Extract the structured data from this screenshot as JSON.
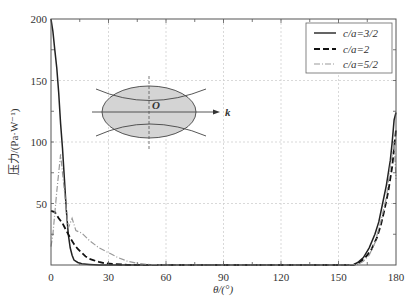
{
  "chart_data": {
    "type": "line",
    "title": "",
    "xlabel": "θ/(°)",
    "ylabel": "压力/(Pa·W⁻¹)",
    "xlim": [
      0,
      180
    ],
    "ylim": [
      0,
      200
    ],
    "x_ticks": [
      "0",
      "30",
      "60",
      "90",
      "120",
      "150",
      "180"
    ],
    "y_ticks": [
      "50",
      "100",
      "150",
      "200"
    ],
    "grid": true,
    "legend_position": "upper right",
    "series": [
      {
        "name": "c/a=3/2",
        "style": "solid",
        "color": "#222222",
        "x": [
          0,
          1,
          2,
          3,
          4,
          5,
          6,
          7,
          8,
          9,
          10,
          11,
          12,
          14,
          16,
          20,
          25,
          30,
          60,
          90,
          120,
          150,
          155,
          158,
          160,
          163,
          166,
          169,
          171,
          173,
          175,
          177,
          178,
          179,
          180
        ],
        "y": [
          200,
          190,
          175,
          160,
          140,
          115,
          95,
          70,
          45,
          25,
          14,
          8,
          4,
          2,
          1,
          0.5,
          0,
          0,
          0,
          0,
          0,
          0,
          0,
          0.5,
          2,
          6,
          14,
          25,
          35,
          50,
          65,
          85,
          100,
          118,
          124
        ]
      },
      {
        "name": "c/a=2",
        "style": "dashed",
        "color": "#111111",
        "x": [
          0,
          2,
          4,
          6,
          8,
          10,
          12,
          14,
          16,
          18,
          20,
          22,
          25,
          28,
          32,
          40,
          60,
          90,
          120,
          150,
          158,
          161,
          164,
          167,
          170,
          172,
          174,
          176,
          178,
          179,
          180
        ],
        "y": [
          44,
          43,
          38,
          34,
          28,
          22,
          17,
          13,
          10,
          7,
          5,
          4,
          2.5,
          1.5,
          0.8,
          0.2,
          0,
          0,
          0,
          0,
          0.2,
          2,
          6,
          12,
          22,
          32,
          45,
          60,
          80,
          95,
          110
        ]
      },
      {
        "name": "c/a=5/2",
        "style": "dash-dot",
        "color": "#999999",
        "x": [
          0,
          1,
          3,
          5,
          7,
          9,
          11,
          13,
          16,
          20,
          25,
          30,
          35,
          40,
          45,
          50,
          60,
          90,
          120,
          150,
          160,
          163,
          166,
          169,
          172,
          175,
          177,
          179,
          180
        ],
        "y": [
          15,
          25,
          60,
          90,
          60,
          30,
          38,
          28,
          26,
          20,
          14,
          10,
          6,
          3,
          1.5,
          0.5,
          0,
          0,
          0,
          0,
          0.5,
          3,
          8,
          18,
          35,
          55,
          80,
          100,
          70
        ]
      }
    ],
    "annotations": [
      {
        "type": "inset-diagram",
        "description": "ellipse with dashed vertical axis, horizontal arrow axis, two hyperbola-like curves",
        "labels": [
          "O",
          "k"
        ]
      }
    ]
  },
  "legend": {
    "items": [
      {
        "label": "c/a=3/2",
        "style": "solid"
      },
      {
        "label": "c/a=2",
        "style": "dashed"
      },
      {
        "label": "c/a=5/2",
        "style": "dash-dot"
      }
    ]
  },
  "inset": {
    "origin_label": "O",
    "axis_label": "k"
  },
  "axes": {
    "xlabel": "θ/(°)",
    "ylabel": "压力/(Pa·W⁻¹)"
  }
}
